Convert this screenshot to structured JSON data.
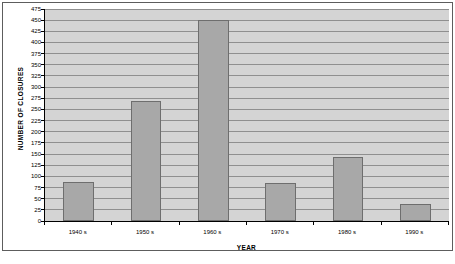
{
  "chart_data": {
    "type": "bar",
    "title": "",
    "xlabel": "YEAR",
    "ylabel": "NUMBER OF CLOSURES",
    "categories": [
      "1940 s",
      "1950 s",
      "1960 s",
      "1970 s",
      "1980 s",
      "1990 s"
    ],
    "values": [
      88,
      268,
      450,
      86,
      144,
      39
    ],
    "ylim": [
      0,
      475
    ],
    "ytick_step": 25,
    "yticks": [
      "0",
      "25",
      "50",
      "75",
      "100",
      "125",
      "150",
      "175",
      "200",
      "225",
      "250",
      "275",
      "300",
      "325",
      "350",
      "375",
      "400",
      "425",
      "450",
      "475"
    ],
    "grid": true,
    "legend": "none",
    "colors": {
      "bar_fill": "#a8a8a8",
      "bar_edge": "#6e6e6e",
      "plot_background": "#d4d4d4",
      "gridline": "#8f8f8f",
      "axis": "#000000",
      "frame": "#5d5d5d",
      "page_background": "#ffffff"
    }
  },
  "figure": {
    "caption": ""
  }
}
